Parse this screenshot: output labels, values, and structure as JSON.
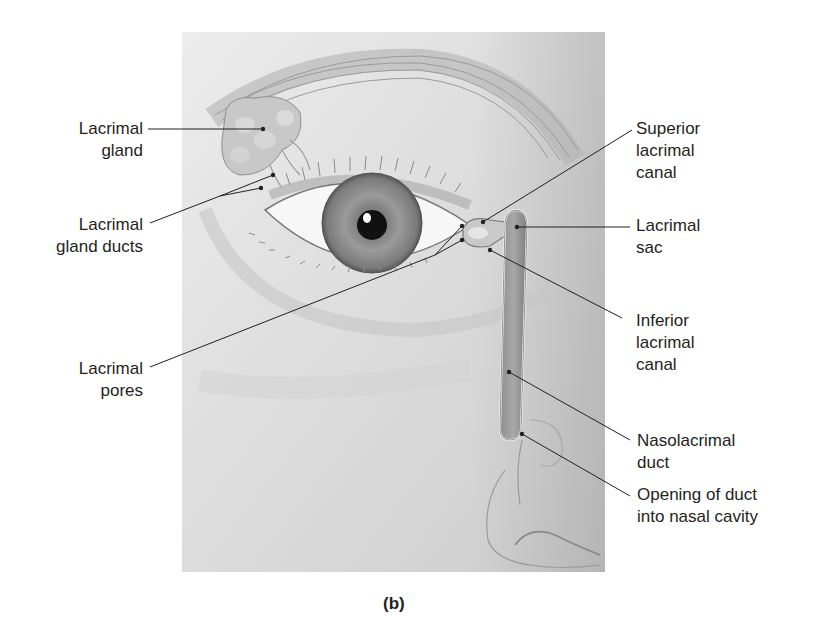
{
  "figure": {
    "caption": "(b)",
    "colors": {
      "background": "#ffffff",
      "label_text": "#231f20",
      "leader_line": "#231f20",
      "skin_light": "#e6e6e6",
      "skin_mid": "#cfcfcf",
      "iris": "#8a8a8a",
      "pupil": "#111111"
    }
  },
  "labels": {
    "lacrimal_gland": {
      "lines": [
        "Lacrimal",
        "gland"
      ]
    },
    "lacrimal_gland_ducts": {
      "lines": [
        "Lacrimal",
        "gland ducts"
      ]
    },
    "lacrimal_pores": {
      "lines": [
        "Lacrimal",
        "pores"
      ]
    },
    "superior_lacrimal_canal": {
      "lines": [
        "Superior",
        "lacrimal",
        "canal"
      ]
    },
    "lacrimal_sac": {
      "lines": [
        "Lacrimal",
        "sac"
      ]
    },
    "inferior_lacrimal_canal": {
      "lines": [
        "Inferior",
        "lacrimal",
        "canal"
      ]
    },
    "nasolacrimal_duct": {
      "lines": [
        "Nasolacrimal",
        "duct"
      ]
    },
    "opening_of_duct": {
      "lines": [
        "Opening of duct",
        "into nasal cavity"
      ]
    }
  }
}
